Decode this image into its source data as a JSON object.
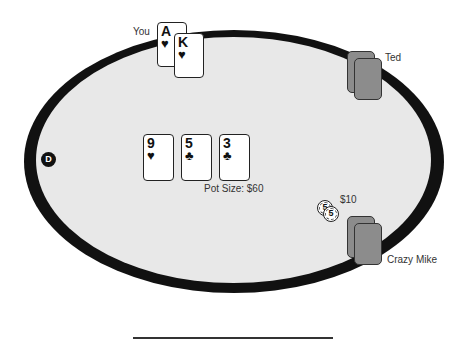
{
  "table": {
    "felt_color": "#e8e8e8",
    "rail_color": "#111111"
  },
  "players": [
    {
      "name": "You",
      "cards": [
        {
          "rank": "A",
          "suit": "♥"
        },
        {
          "rank": "K",
          "suit": "♥"
        }
      ]
    },
    {
      "name": "Ted",
      "cards": "face-down"
    },
    {
      "name": "Crazy Mike",
      "cards": "face-down",
      "bet": "$10",
      "chips": [
        "5",
        "5"
      ]
    }
  ],
  "dealer_button": "D",
  "board": [
    {
      "rank": "9",
      "suit": "♥"
    },
    {
      "rank": "5",
      "suit": "♣"
    },
    {
      "rank": "3",
      "suit": "♣"
    }
  ],
  "pot": {
    "label": "Pot Size: $60"
  },
  "card_back_color": "#8c8c8c"
}
